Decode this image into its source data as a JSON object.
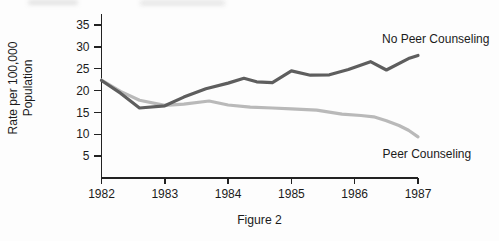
{
  "figure": {
    "caption": "Figure 2"
  },
  "chart_data": {
    "type": "line",
    "title": "",
    "xlabel": "",
    "ylabel": "Rate per 100,000 Population",
    "ylabel_lines": [
      "Rate per 100,000",
      "Population"
    ],
    "x_ticks": [
      "1982",
      "1983",
      "1984",
      "1985",
      "1986",
      "1987"
    ],
    "y_ticks": [
      35,
      30,
      25,
      20,
      15,
      10,
      5
    ],
    "xlim": [
      1982,
      1987
    ],
    "ylim": [
      0,
      37.5
    ],
    "grid": false,
    "legend_position": "inline-labels",
    "axis_color": "#222222",
    "text_color": "#1b1b1b",
    "series": [
      {
        "name": "Peer Counseling",
        "color": "#b9b9b9",
        "label_x": 1987.14,
        "label_y": 5.6,
        "points": [
          [
            1982.0,
            22.4
          ],
          [
            1982.3,
            19.8
          ],
          [
            1982.6,
            17.8
          ],
          [
            1983.0,
            16.6
          ],
          [
            1983.3,
            16.9
          ],
          [
            1983.7,
            17.6
          ],
          [
            1984.0,
            16.7
          ],
          [
            1984.35,
            16.2
          ],
          [
            1984.7,
            16.0
          ],
          [
            1985.0,
            15.8
          ],
          [
            1985.4,
            15.5
          ],
          [
            1985.8,
            14.6
          ],
          [
            1986.1,
            14.3
          ],
          [
            1986.3,
            14.0
          ],
          [
            1986.5,
            13.1
          ],
          [
            1986.7,
            12.0
          ],
          [
            1986.85,
            10.9
          ],
          [
            1987.0,
            9.4
          ]
        ]
      },
      {
        "name": "No Peer Counseling",
        "color": "#5e5e5e",
        "label_x": 1987.28,
        "label_y": 31.9,
        "points": [
          [
            1982.0,
            22.3
          ],
          [
            1982.3,
            19.4
          ],
          [
            1982.6,
            16.0
          ],
          [
            1983.0,
            16.5
          ],
          [
            1983.3,
            18.5
          ],
          [
            1983.65,
            20.4
          ],
          [
            1984.0,
            21.7
          ],
          [
            1984.25,
            22.8
          ],
          [
            1984.45,
            22.0
          ],
          [
            1984.7,
            21.8
          ],
          [
            1985.0,
            24.5
          ],
          [
            1985.3,
            23.5
          ],
          [
            1985.6,
            23.6
          ],
          [
            1985.9,
            24.8
          ],
          [
            1986.25,
            26.6
          ],
          [
            1986.5,
            24.7
          ],
          [
            1986.85,
            27.3
          ],
          [
            1987.0,
            28.0
          ]
        ]
      }
    ]
  }
}
